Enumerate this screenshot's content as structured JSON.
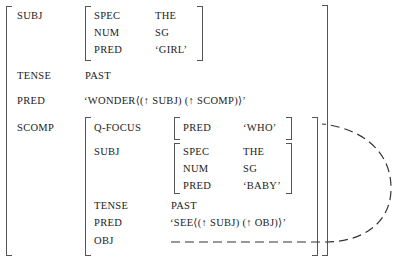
{
  "fstructure": {
    "subj": {
      "label": "SUBJ",
      "features": [
        {
          "attr": "SPEC",
          "value": "THE"
        },
        {
          "attr": "NUM",
          "value": "SG"
        },
        {
          "attr": "PRED",
          "value": "‘GIRL’"
        }
      ]
    },
    "tense": {
      "label": "TENSE",
      "value": "PAST"
    },
    "pred": {
      "label": "PRED",
      "value": "‘WONDER⟨(↑ SUBJ) (↑ SCOMP)⟩’"
    },
    "scomp": {
      "label": "SCOMP",
      "qfocus": {
        "label": "Q-FOCUS",
        "features": [
          {
            "attr": "PRED",
            "value": "‘WHO’"
          }
        ]
      },
      "subj": {
        "label": "SUBJ",
        "features": [
          {
            "attr": "SPEC",
            "value": "THE"
          },
          {
            "attr": "NUM",
            "value": "SG"
          },
          {
            "attr": "PRED",
            "value": "‘BABY’"
          }
        ]
      },
      "tense": {
        "label": "TENSE",
        "value": "PAST"
      },
      "pred": {
        "label": "PRED",
        "value": "‘SEE⟨(↑ SUBJ) (↑ OBJ)⟩’"
      },
      "obj": {
        "label": "OBJ",
        "value": ""
      }
    }
  },
  "links": [
    {
      "from": "scomp.obj",
      "to": "scomp.qfocus",
      "style": "dashed"
    }
  ]
}
